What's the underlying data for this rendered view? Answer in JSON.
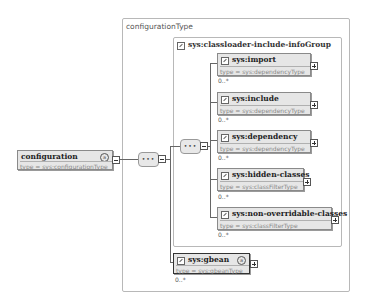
{
  "diagram": {
    "outer_frame": {
      "title": "configurationType"
    },
    "group_frame": {
      "title": "sys:classloader-include-infoGroup"
    },
    "root": {
      "name": "configuration",
      "type": "type = sys:configurationType",
      "attr_icon": "a"
    },
    "compositors": [
      {
        "kind": "sequence",
        "symbol": "•••"
      },
      {
        "kind": "sequence",
        "symbol": "•••"
      }
    ],
    "group_elements": [
      {
        "name": "sys:import",
        "type": "type = sys:dependencyType",
        "cardinality": "0..*"
      },
      {
        "name": "sys:include",
        "type": "type = sys:dependencyType",
        "cardinality": "0..*"
      },
      {
        "name": "sys:dependency",
        "type": "type = sys:dependencyType",
        "cardinality": "0..*"
      },
      {
        "name": "sys:hidden-classes",
        "type": "type = sys:classFilterType",
        "cardinality": "0..*"
      },
      {
        "name": "sys:non-overridable-classes",
        "type": "type = sys:classFilterType",
        "cardinality": "0..*"
      }
    ],
    "gbean": {
      "name": "sys:gbean",
      "type": "type = sys:gbeanType",
      "cardinality": "0..*",
      "attr_icon": "a"
    }
  }
}
